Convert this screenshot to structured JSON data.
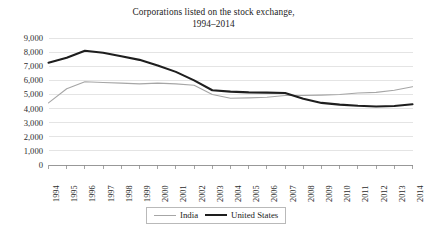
{
  "chart_data": {
    "type": "line",
    "title": "Corporations listed on the stock exchange,",
    "subtitle": "1994–2014",
    "xlabel": "",
    "ylabel": "",
    "grid": true,
    "legend_position": "bottom-center",
    "ylim": [
      0,
      9000
    ],
    "ytick_labels": [
      "9,000",
      "8,000",
      "7,000",
      "6,000",
      "5,000",
      "4,000",
      "3,000",
      "2,000",
      "1,000",
      "0"
    ],
    "ytick_values": [
      9000,
      8000,
      7000,
      6000,
      5000,
      4000,
      3000,
      2000,
      1000,
      0
    ],
    "categories": [
      "1994",
      "1995",
      "1996",
      "1997",
      "1998",
      "1999",
      "2000",
      "2001",
      "2002",
      "2003",
      "2004",
      "2005",
      "2006",
      "2007",
      "2008",
      "2009",
      "2010",
      "2011",
      "2012",
      "2013",
      "2014"
    ],
    "x": [
      1994,
      1995,
      1996,
      1997,
      1998,
      1999,
      2000,
      2001,
      2002,
      2003,
      2004,
      2005,
      2006,
      2007,
      2008,
      2009,
      2010,
      2011,
      2012,
      2013,
      2014
    ],
    "series": [
      {
        "name": "India",
        "color": "#a6a6a6",
        "width": 1.1,
        "values": [
          4400,
          5400,
          5900,
          5850,
          5800,
          5750,
          5800,
          5750,
          5650,
          5000,
          4730,
          4760,
          4800,
          4920,
          4920,
          4950,
          5000,
          5100,
          5150,
          5300,
          5550
        ]
      },
      {
        "name": "United States",
        "color": "#1e1e1e",
        "width": 2.1,
        "values": [
          7250,
          7600,
          8100,
          7950,
          7700,
          7450,
          7050,
          6600,
          6000,
          5300,
          5200,
          5150,
          5130,
          5100,
          4700,
          4400,
          4280,
          4200,
          4150,
          4180,
          4300
        ]
      }
    ]
  }
}
